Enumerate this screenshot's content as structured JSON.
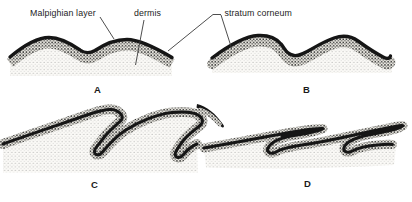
{
  "figure": {
    "type": "labeled-anatomy-diagram",
    "background": "#ffffff",
    "ink_color": "#161616",
    "leader_line_color": "#3a3a3a",
    "labels": {
      "malpighian": "Malpighian layer",
      "dermis": "dermis",
      "stratum_corneum": "stratum corneum"
    },
    "panels": [
      {
        "letter": "A"
      },
      {
        "letter": "B"
      },
      {
        "letter": "C"
      },
      {
        "letter": "D"
      }
    ]
  }
}
